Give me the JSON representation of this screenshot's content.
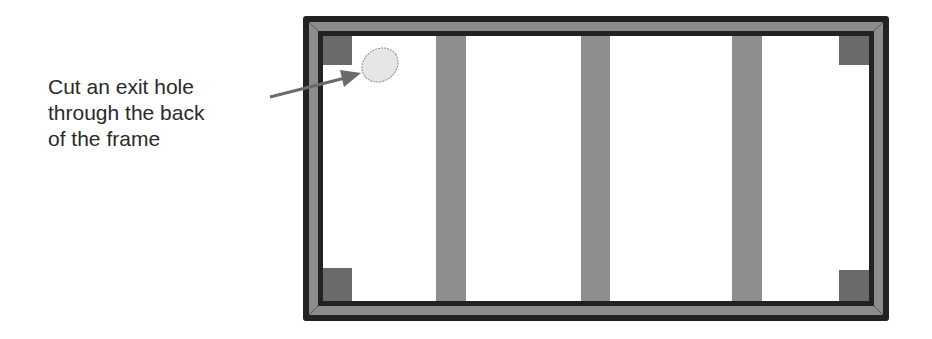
{
  "diagram": {
    "callout": {
      "lines": [
        "Cut an exit hole",
        "through the back",
        "of the frame"
      ]
    },
    "frame": {
      "outer": {
        "x": 303,
        "y": 16,
        "width": 586,
        "height": 305
      },
      "studs": [
        {
          "x": 436,
          "width": 30
        },
        {
          "x": 581,
          "width": 29
        },
        {
          "x": 732,
          "width": 30
        }
      ],
      "corner_blocks": [
        "top-left",
        "top-right",
        "bottom-left",
        "bottom-right"
      ],
      "exit_hole": {
        "cx": 380,
        "cy": 64,
        "rx": 18,
        "ry": 15
      }
    },
    "colors": {
      "frame_dark": "#222222",
      "frame_mid": "#8c8c8c",
      "stud": "#8e8e8e",
      "corner_block": "#6a6a6a",
      "hole_fill": "#e6e6e6",
      "arrow": "#6b6b6b",
      "text": "#2a2a2a"
    }
  }
}
